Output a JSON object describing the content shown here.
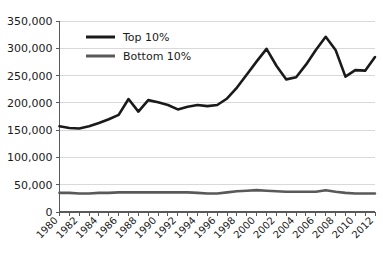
{
  "chart_data": {
    "type": "line",
    "title": "",
    "subtitle": "",
    "xlabel": "",
    "ylabel": "",
    "xlim": [
      1980,
      2012
    ],
    "ylim": [
      0,
      350000
    ],
    "grid": "horizontal",
    "legend_position": "top-left-inside",
    "y_ticks": [
      0,
      50000,
      100000,
      150000,
      200000,
      250000,
      300000,
      350000
    ],
    "y_tick_labels": [
      "0",
      "50,000",
      "100,000",
      "150,000",
      "200,000",
      "250,000",
      "300,000",
      "350,000"
    ],
    "x": [
      1980,
      1981,
      1982,
      1983,
      1984,
      1985,
      1986,
      1987,
      1988,
      1989,
      1990,
      1991,
      1992,
      1993,
      1994,
      1995,
      1996,
      1997,
      1998,
      1999,
      2000,
      2001,
      2002,
      2003,
      2004,
      2005,
      2006,
      2007,
      2008,
      2009,
      2010,
      2011,
      2012
    ],
    "x_tick_labels": [
      "1980",
      "1982",
      "1984",
      "1986",
      "1988",
      "1990",
      "1992",
      "1994",
      "1996",
      "1998",
      "2000",
      "2002",
      "2004",
      "2006",
      "2008",
      "2010",
      "2012"
    ],
    "x_tick_label_rotation": -45,
    "series": [
      {
        "name": "Top 10%",
        "color": "#1a1a1a",
        "line_width": 2.6,
        "values": [
          157000,
          154000,
          153000,
          157000,
          163000,
          170000,
          178000,
          207000,
          184000,
          205000,
          201000,
          196000,
          188000,
          193000,
          196000,
          194000,
          196000,
          208000,
          228000,
          252000,
          276000,
          299000,
          268000,
          243000,
          247000,
          270000,
          297000,
          321000,
          297000,
          248000,
          260000,
          259000,
          284000
        ]
      },
      {
        "name": "Bottom 10%",
        "color": "#595959",
        "line_width": 2.6,
        "values": [
          35000,
          35000,
          34000,
          34000,
          35000,
          35000,
          36000,
          36000,
          36000,
          36000,
          36000,
          36000,
          36000,
          36000,
          35000,
          34000,
          34000,
          36000,
          38000,
          39000,
          40000,
          39000,
          38000,
          37000,
          37000,
          37000,
          37000,
          40000,
          37000,
          35000,
          34000,
          34000,
          34000
        ]
      }
    ]
  },
  "legend": {
    "items": [
      {
        "label": "Top 10%",
        "color": "#1a1a1a"
      },
      {
        "label": "Bottom 10%",
        "color": "#595959"
      }
    ]
  },
  "colors": {
    "background": "#ffffff",
    "gridline": "#d9d9d9",
    "axis": "#595959",
    "text": "#1a1a1a",
    "series_top": "#1a1a1a",
    "series_bottom": "#595959"
  }
}
